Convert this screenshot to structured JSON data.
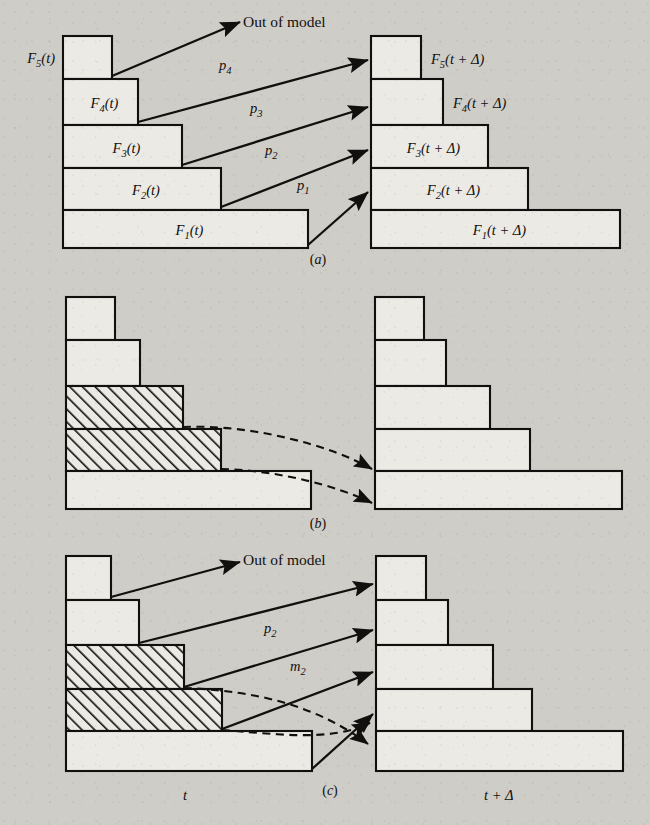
{
  "figure": {
    "title_absent": true,
    "background_color": "#cfcdc8",
    "ink_color": "#12100e",
    "bar_fill": "#eceae5",
    "panels": [
      {
        "id": "a",
        "letter": "(a)",
        "letter_x": 318,
        "letter_y": 264,
        "left_bars": [
          {
            "name": "F5t",
            "label_main": "F",
            "label_sub": "5",
            "label_tail": "(t)",
            "label_pos": "outside-left",
            "x": 63,
            "y": 36,
            "w": 49,
            "h": 43
          },
          {
            "name": "F4t",
            "label_main": "F",
            "label_sub": "4",
            "label_tail": "(t)",
            "label_pos": "inside",
            "x": 63,
            "y": 79,
            "w": 75,
            "h": 46
          },
          {
            "name": "F3t",
            "label_main": "F",
            "label_sub": "3",
            "label_tail": "(t)",
            "label_pos": "inside",
            "x": 63,
            "y": 125,
            "w": 119,
            "h": 43
          },
          {
            "name": "F2t",
            "label_main": "F",
            "label_sub": "2",
            "label_tail": "(t)",
            "label_pos": "inside",
            "x": 63,
            "y": 168,
            "w": 158,
            "h": 42
          },
          {
            "name": "F1t",
            "label_main": "F",
            "label_sub": "1",
            "label_tail": "(t)",
            "label_pos": "inside",
            "x": 63,
            "y": 210,
            "w": 245,
            "h": 38
          }
        ],
        "right_bars": [
          {
            "name": "F5td",
            "label_main": "F",
            "label_sub": "5",
            "label_tail": "(t + Δ)",
            "label_pos": "outside-right",
            "x": 371,
            "y": 36,
            "w": 50,
            "h": 43
          },
          {
            "name": "F4td",
            "label_main": "F",
            "label_sub": "4",
            "label_tail": "(t + Δ)",
            "label_pos": "outside-right",
            "x": 371,
            "y": 79,
            "w": 72,
            "h": 46
          },
          {
            "name": "F3td",
            "label_main": "F",
            "label_sub": "3",
            "label_tail": "(t + Δ)",
            "label_pos": "inside",
            "x": 371,
            "y": 125,
            "w": 117,
            "h": 43
          },
          {
            "name": "F2td",
            "label_main": "F",
            "label_sub": "2",
            "label_tail": "(t + Δ)",
            "label_pos": "inside",
            "x": 371,
            "y": 168,
            "w": 157,
            "h": 42
          },
          {
            "name": "F1td",
            "label_main": "F",
            "label_sub": "1",
            "label_tail": "(t + Δ)",
            "label_pos": "inside",
            "x": 371,
            "y": 210,
            "w": 249,
            "h": 38
          }
        ],
        "arrows": [
          {
            "name": "out-of-model-arrow",
            "type": "solid",
            "x1": 112,
            "y1": 76,
            "x2": 240,
            "y2": 22
          },
          {
            "name": "p4-arrow",
            "type": "solid",
            "x1": 138,
            "y1": 122,
            "x2": 368,
            "y2": 60
          },
          {
            "name": "p3-arrow",
            "type": "solid",
            "x1": 182,
            "y1": 165,
            "x2": 368,
            "y2": 107
          },
          {
            "name": "p2-arrow",
            "type": "solid",
            "x1": 221,
            "y1": 207,
            "x2": 368,
            "y2": 150
          },
          {
            "name": "p1-arrow",
            "type": "solid",
            "x1": 308,
            "y1": 245,
            "x2": 368,
            "y2": 192
          }
        ],
        "arrow_labels": [
          {
            "name": "out-of-model-label",
            "text": "Out of model",
            "x": 243,
            "y": 27,
            "style": "plain"
          },
          {
            "name": "p4-label",
            "main": "p",
            "sub": "4",
            "x": 219,
            "y": 70
          },
          {
            "name": "p3-label",
            "main": "p",
            "sub": "3",
            "x": 250,
            "y": 113
          },
          {
            "name": "p2-label",
            "main": "p",
            "sub": "2",
            "x": 265,
            "y": 155
          },
          {
            "name": "p1-label",
            "main": "p",
            "sub": "1",
            "x": 297,
            "y": 190
          }
        ]
      },
      {
        "id": "b",
        "letter": "(b)",
        "letter_x": 318,
        "letter_y": 528,
        "left_bars": [
          {
            "name": "b-left-bar-5",
            "hatched": false,
            "x": 66,
            "y": 297,
            "w": 49,
            "h": 43
          },
          {
            "name": "b-left-bar-4",
            "hatched": false,
            "x": 66,
            "y": 340,
            "w": 74,
            "h": 46
          },
          {
            "name": "b-left-bar-3",
            "hatched": true,
            "x": 66,
            "y": 386,
            "w": 117,
            "h": 43
          },
          {
            "name": "b-left-bar-2",
            "hatched": true,
            "x": 66,
            "y": 429,
            "w": 155,
            "h": 42
          },
          {
            "name": "b-left-bar-1",
            "hatched": false,
            "x": 66,
            "y": 471,
            "w": 245,
            "h": 38
          }
        ],
        "right_bars": [
          {
            "name": "b-right-bar-5",
            "x": 375,
            "y": 297,
            "w": 49,
            "h": 43
          },
          {
            "name": "b-right-bar-4",
            "x": 375,
            "y": 340,
            "w": 71,
            "h": 46
          },
          {
            "name": "b-right-bar-3",
            "x": 375,
            "y": 386,
            "w": 115,
            "h": 43
          },
          {
            "name": "b-right-bar-2",
            "x": 375,
            "y": 429,
            "w": 155,
            "h": 42
          },
          {
            "name": "b-right-bar-1",
            "x": 375,
            "y": 471,
            "w": 247,
            "h": 38
          }
        ],
        "dashed_arrows": [
          {
            "name": "b-dashed-arrow-upper",
            "d": "M 183 427 C 250 424, 330 445, 372 469"
          },
          {
            "name": "b-dashed-arrow-lower",
            "d": "M 221 469 C 275 470, 335 485, 372 503"
          }
        ]
      },
      {
        "id": "c",
        "letter": "(c)",
        "letter_x": 330,
        "letter_y": 795,
        "left_bars": [
          {
            "name": "c-left-bar-5",
            "hatched": false,
            "x": 66,
            "y": 556,
            "w": 45,
            "h": 44
          },
          {
            "name": "c-left-bar-4",
            "hatched": false,
            "x": 66,
            "y": 600,
            "w": 73,
            "h": 45
          },
          {
            "name": "c-left-bar-3",
            "hatched": true,
            "x": 66,
            "y": 645,
            "w": 118,
            "h": 44
          },
          {
            "name": "c-left-bar-2",
            "hatched": true,
            "x": 66,
            "y": 689,
            "w": 156,
            "h": 42
          },
          {
            "name": "c-left-bar-1",
            "hatched": false,
            "x": 66,
            "y": 731,
            "w": 246,
            "h": 40
          }
        ],
        "right_bars": [
          {
            "name": "c-right-bar-5",
            "x": 376,
            "y": 556,
            "w": 50,
            "h": 44
          },
          {
            "name": "c-right-bar-4",
            "x": 376,
            "y": 600,
            "w": 72,
            "h": 45
          },
          {
            "name": "c-right-bar-3",
            "x": 376,
            "y": 645,
            "w": 117,
            "h": 44
          },
          {
            "name": "c-right-bar-2",
            "x": 376,
            "y": 689,
            "w": 156,
            "h": 42
          },
          {
            "name": "c-right-bar-1",
            "x": 376,
            "y": 731,
            "w": 247,
            "h": 40
          }
        ],
        "solid_arrows": [
          {
            "name": "c-out-of-model-arrow",
            "x1": 111,
            "y1": 597,
            "x2": 240,
            "y2": 562
          },
          {
            "name": "c-arrow-to-f5",
            "x1": 139,
            "y1": 643,
            "x2": 373,
            "y2": 584
          },
          {
            "name": "c-arrow-p2",
            "x1": 184,
            "y1": 687,
            "x2": 373,
            "y2": 630
          },
          {
            "name": "c-arrow-to-f3",
            "x1": 222,
            "y1": 729,
            "x2": 373,
            "y2": 672
          },
          {
            "name": "c-arrow-to-f2",
            "x1": 312,
            "y1": 769,
            "x2": 373,
            "y2": 714
          }
        ],
        "dashed_arrows": [
          {
            "name": "c-dashed-arrow-upper",
            "d": "M 184 688 C 240 690, 310 700, 368 744"
          },
          {
            "name": "c-dashed-arrow-lower",
            "d": "M 222 730 C 270 733, 330 743, 370 723"
          }
        ],
        "arrow_labels": [
          {
            "name": "c-out-of-model-label",
            "text": "Out of model",
            "x": 243,
            "y": 565,
            "style": "plain"
          },
          {
            "name": "c-p2-label",
            "main": "p",
            "sub": "2",
            "x": 264,
            "y": 633
          },
          {
            "name": "c-m2-label",
            "main": "m",
            "sub": "2",
            "x": 290,
            "y": 671
          }
        ]
      }
    ],
    "axis_labels": [
      {
        "name": "axis-label-t",
        "text": "t",
        "x": 183,
        "y": 800
      },
      {
        "name": "axis-label-t-plus-delta",
        "text": "t + Δ",
        "x": 484,
        "y": 800
      }
    ]
  }
}
